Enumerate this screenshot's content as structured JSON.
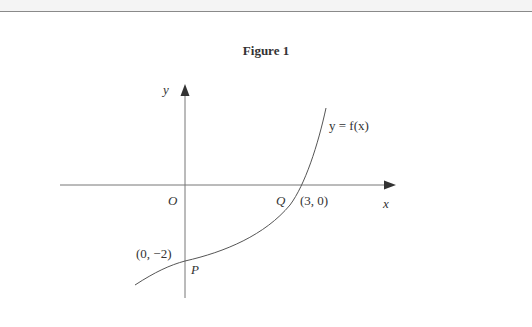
{
  "figure": {
    "title": "Figure 1",
    "x_axis_label": "x",
    "y_axis_label": "y",
    "origin_label": "O",
    "curve_label": "y = f(x)",
    "points": [
      {
        "name": "P",
        "coords_label": "(0, −2)",
        "x": 0,
        "y": -2
      },
      {
        "name": "Q",
        "coords_label": "(3, 0)",
        "x": 3,
        "y": 0
      }
    ]
  }
}
